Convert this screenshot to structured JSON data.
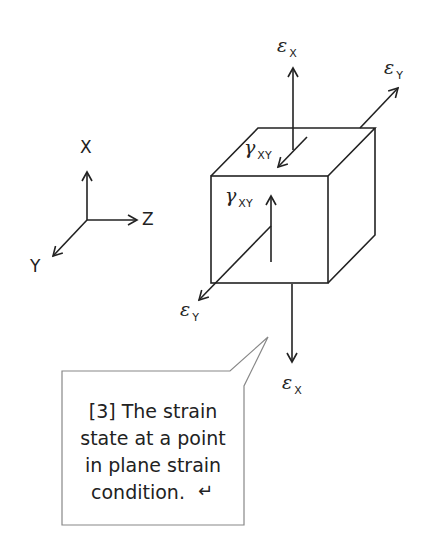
{
  "figure": {
    "axes": {
      "x_label": "X",
      "y_label": "Y",
      "z_label": "Z"
    },
    "labels": {
      "eps_x_top": {
        "symbol": "ε",
        "sub": "X"
      },
      "eps_y_top": {
        "symbol": "ε",
        "sub": "Y"
      },
      "gamma_xy_top": {
        "symbol": "γ",
        "sub": "XY"
      },
      "gamma_xy_front": {
        "symbol": "γ",
        "sub": "XY"
      },
      "eps_y_front": {
        "symbol": "ε",
        "sub": "Y"
      },
      "eps_x_bottom": {
        "symbol": "ε",
        "sub": "X"
      }
    },
    "callout": {
      "lines": [
        "[3] The strain",
        "state at a point",
        "in plane strain",
        "condition."
      ],
      "return_glyph": "↵"
    },
    "colors": {
      "stroke": "#222222",
      "callout_border": "#888888",
      "background": "#ffffff"
    }
  }
}
